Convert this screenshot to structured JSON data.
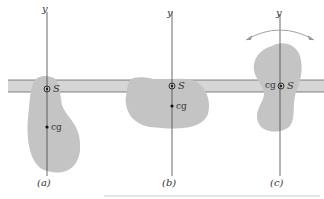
{
  "diagram": {
    "axis_label": "y",
    "pivot_label": "S",
    "cg_label": "cg",
    "panels": [
      {
        "id": "a",
        "caption": "(a)"
      },
      {
        "id": "b",
        "caption": "(b)"
      },
      {
        "id": "c",
        "caption": "(c)"
      }
    ],
    "colors": {
      "body": "#c4c4c4",
      "bar": "#d6d6d6",
      "line": "#444444"
    }
  }
}
